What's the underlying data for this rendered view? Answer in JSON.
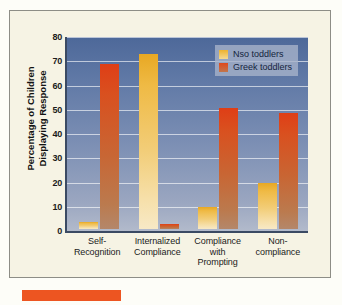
{
  "chart_data": {
    "type": "bar",
    "title": "",
    "xlabel": "",
    "ylabel": "Percentage of Children Displaying Response",
    "ylim": [
      0,
      80
    ],
    "yticks": [
      0,
      10,
      20,
      30,
      40,
      50,
      60,
      70,
      80
    ],
    "grid": true,
    "legend_position": "top-right",
    "categories": [
      "Self-\nRecognition",
      "Internalized\nCompliance",
      "Compliance\nwith\nPrompting",
      "Non-\ncompliance"
    ],
    "series": [
      {
        "name": "Nso toddlers",
        "color": "#edb22e",
        "values": [
          3,
          72,
          9,
          19
        ]
      },
      {
        "name": "Greek toddlers",
        "color": "#de4419",
        "values": [
          68,
          2,
          50,
          48
        ]
      }
    ]
  },
  "ylabel_lines": [
    "Percentage of Children",
    "Displaying Response"
  ],
  "xlabels": [
    [
      "Self-",
      "Recognition"
    ],
    [
      "Internalized",
      "Compliance"
    ],
    [
      "Compliance",
      "with",
      "Prompting"
    ],
    [
      "Non-",
      "compliance"
    ]
  ],
  "colors": {
    "card_background": "#f6f3e4",
    "card_border": "#8d8d86",
    "plot_top": "#4d6899",
    "plot_bottom": "#b2bacb",
    "axis": "#3b4a63",
    "nso": "#edb22e",
    "greek": "#de4419",
    "footer_marker": "#ed5521"
  }
}
